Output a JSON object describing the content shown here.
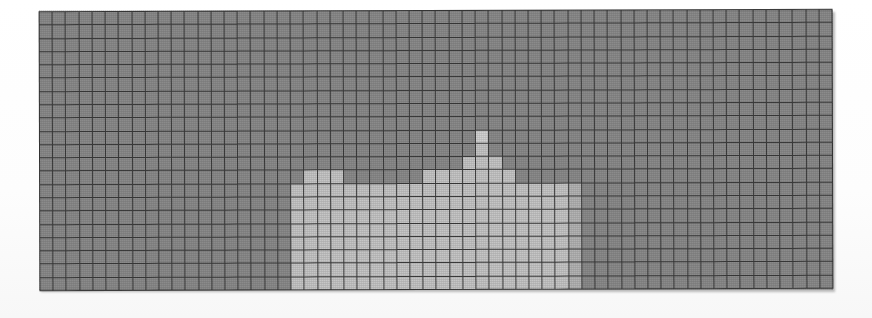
{
  "figure": {
    "type_label": "heatmap"
  },
  "palette": {
    "background_cell": "#8b8b8b",
    "gridline": "#3b3b3b",
    "page": "#ffffff",
    "level_0": "#8b8b8b",
    "level_1": "#9d9d9d",
    "level_2": "#b4b4b4",
    "level_3": "#c6c6c6",
    "level_4": "#d2d2d2",
    "level_5": "#dcdcdc"
  },
  "chart_data": {
    "type": "heatmap",
    "subtitle": "",
    "xlabel": "",
    "ylabel": "",
    "xticklabels": [],
    "yticklabels": [],
    "legend": [],
    "annotations": [],
    "grid": true,
    "gridline_color": "#3b3b3b",
    "ncols": 60,
    "nrows": 21,
    "xlim": [
      0,
      60
    ],
    "ylim": [
      0,
      21
    ],
    "zlim": [
      0,
      5
    ],
    "colorscale": [
      "#8b8b8b",
      "#9d9d9d",
      "#b4b4b4",
      "#c6c6c6",
      "#d2d2d2",
      "#dcdcdc"
    ],
    "values": [
      [
        0,
        0,
        0,
        0,
        0,
        0,
        0,
        0,
        0,
        0,
        0,
        0,
        0,
        0,
        0,
        0,
        0,
        0,
        0,
        0,
        0,
        0,
        0,
        0,
        0,
        0,
        0,
        0,
        0,
        0,
        0,
        0,
        0,
        0,
        0,
        0,
        0,
        0,
        0,
        0,
        0,
        0,
        0,
        0,
        0,
        0,
        0,
        0,
        0,
        0,
        0,
        0,
        0,
        0,
        0,
        0,
        0,
        0,
        0,
        0
      ],
      [
        0,
        0,
        0,
        0,
        0,
        0,
        0,
        0,
        0,
        0,
        0,
        0,
        0,
        0,
        0,
        0,
        0,
        0,
        0,
        0,
        0,
        0,
        0,
        0,
        0,
        0,
        0,
        0,
        0,
        0,
        0,
        0,
        0,
        0,
        0,
        0,
        0,
        0,
        0,
        0,
        0,
        0,
        0,
        0,
        0,
        0,
        0,
        0,
        0,
        0,
        0,
        0,
        0,
        0,
        0,
        0,
        0,
        0,
        0,
        0
      ],
      [
        0,
        0,
        0,
        0,
        0,
        0,
        0,
        0,
        0,
        0,
        0,
        0,
        0,
        0,
        0,
        0,
        0,
        0,
        0,
        0,
        0,
        0,
        0,
        0,
        0,
        0,
        0,
        0,
        0,
        0,
        0,
        0,
        0,
        0,
        0,
        0,
        0,
        0,
        0,
        0,
        0,
        0,
        0,
        0,
        0,
        0,
        0,
        0,
        0,
        0,
        0,
        0,
        0,
        0,
        0,
        0,
        0,
        0,
        0,
        0
      ],
      [
        0,
        0,
        0,
        0,
        0,
        0,
        0,
        0,
        0,
        0,
        0,
        0,
        0,
        0,
        0,
        0,
        0,
        0,
        0,
        0,
        0,
        0,
        0,
        0,
        0,
        0,
        0,
        0,
        0,
        0,
        0,
        0,
        0,
        0,
        0,
        0,
        0,
        0,
        0,
        0,
        0,
        0,
        0,
        0,
        0,
        0,
        0,
        0,
        0,
        0,
        0,
        0,
        0,
        0,
        0,
        0,
        0,
        0,
        0,
        0
      ],
      [
        0,
        0,
        0,
        0,
        0,
        0,
        0,
        0,
        0,
        0,
        0,
        0,
        0,
        0,
        0,
        0,
        0,
        0,
        0,
        0,
        0,
        0,
        0,
        0,
        0,
        0,
        0,
        0,
        0,
        0,
        0,
        0,
        0,
        0,
        0,
        0,
        0,
        0,
        0,
        0,
        0,
        0,
        0,
        0,
        0,
        0,
        0,
        0,
        0,
        0,
        0,
        0,
        0,
        0,
        0,
        0,
        0,
        0,
        0,
        0
      ],
      [
        0,
        0,
        0,
        0,
        0,
        0,
        0,
        0,
        0,
        0,
        0,
        0,
        0,
        0,
        0,
        0,
        0,
        0,
        0,
        0,
        0,
        0,
        0,
        0,
        0,
        0,
        0,
        0,
        0,
        0,
        0,
        0,
        0,
        0,
        0,
        0,
        0,
        0,
        0,
        0,
        0,
        0,
        0,
        0,
        0,
        0,
        0,
        0,
        0,
        0,
        0,
        0,
        0,
        0,
        0,
        0,
        0,
        0,
        0,
        0
      ],
      [
        0,
        0,
        0,
        0,
        0,
        0,
        0,
        0,
        0,
        0,
        0,
        0,
        0,
        0,
        0,
        0,
        0,
        0,
        0,
        0,
        0,
        0,
        0,
        0,
        0,
        0,
        0,
        0,
        0,
        0,
        0,
        0,
        0,
        0,
        0,
        0,
        0,
        0,
        0,
        0,
        0,
        0,
        0,
        0,
        0,
        0,
        0,
        0,
        0,
        0,
        0,
        0,
        0,
        0,
        0,
        0,
        0,
        0,
        0,
        0
      ],
      [
        0,
        0,
        0,
        0,
        0,
        0,
        0,
        0,
        0,
        0,
        0,
        0,
        0,
        0,
        0,
        0,
        0,
        0,
        0,
        0,
        0,
        0,
        0,
        0,
        0,
        0,
        0,
        0,
        0,
        0,
        0,
        0,
        0,
        0,
        0,
        0,
        0,
        0,
        0,
        0,
        0,
        0,
        0,
        0,
        0,
        0,
        0,
        0,
        0,
        0,
        0,
        0,
        0,
        0,
        0,
        0,
        0,
        0,
        0,
        0
      ],
      [
        0,
        0,
        0,
        0,
        0,
        0,
        0,
        0,
        0,
        0,
        0,
        0,
        0,
        0,
        0,
        0,
        0,
        0,
        0,
        0,
        0,
        0,
        0,
        0,
        0,
        0,
        0,
        0,
        0,
        0,
        0,
        0,
        0,
        0,
        0,
        0,
        0,
        0,
        0,
        0,
        0,
        0,
        0,
        0,
        0,
        0,
        0,
        0,
        0,
        0,
        0,
        0,
        0,
        0,
        0,
        0,
        0,
        0,
        0,
        0
      ],
      [
        0,
        0,
        0,
        0,
        0,
        0,
        0,
        0,
        0,
        0,
        0,
        0,
        0,
        0,
        0,
        0,
        0,
        0,
        0,
        0,
        0,
        0,
        0,
        0,
        0,
        0,
        0,
        0,
        0,
        0,
        0,
        0,
        0,
        4,
        0,
        0,
        0,
        0,
        0,
        0,
        0,
        0,
        0,
        0,
        0,
        0,
        0,
        0,
        0,
        0,
        0,
        0,
        0,
        0,
        0,
        0,
        0,
        0,
        0,
        0
      ],
      [
        0,
        0,
        0,
        0,
        0,
        0,
        0,
        0,
        0,
        0,
        0,
        0,
        0,
        0,
        0,
        0,
        0,
        0,
        0,
        0,
        0,
        0,
        0,
        0,
        0,
        0,
        0,
        0,
        0,
        0,
        0,
        0,
        0,
        3,
        0,
        0,
        0,
        0,
        0,
        0,
        0,
        0,
        0,
        0,
        0,
        0,
        0,
        0,
        0,
        0,
        0,
        0,
        0,
        0,
        0,
        0,
        0,
        0,
        0,
        0
      ],
      [
        0,
        0,
        0,
        0,
        0,
        0,
        0,
        0,
        0,
        0,
        0,
        0,
        0,
        0,
        0,
        0,
        0,
        0,
        0,
        0,
        0,
        0,
        0,
        0,
        0,
        0,
        0,
        0,
        0,
        0,
        0,
        0,
        3,
        3,
        3,
        0,
        0,
        0,
        0,
        0,
        0,
        0,
        0,
        0,
        0,
        0,
        0,
        0,
        0,
        0,
        0,
        0,
        0,
        0,
        0,
        0,
        0,
        0,
        0,
        0
      ],
      [
        0,
        0,
        0,
        0,
        0,
        0,
        0,
        0,
        0,
        0,
        0,
        0,
        0,
        0,
        0,
        0,
        0,
        0,
        0,
        0,
        3,
        3,
        3,
        0,
        0,
        0,
        0,
        0,
        0,
        3,
        3,
        3,
        3,
        3,
        3,
        3,
        0,
        0,
        0,
        0,
        0,
        0,
        0,
        0,
        0,
        0,
        0,
        0,
        0,
        0,
        0,
        0,
        0,
        0,
        0,
        0,
        0,
        0,
        0,
        0
      ],
      [
        0,
        0,
        0,
        0,
        0,
        0,
        0,
        0,
        0,
        0,
        0,
        0,
        0,
        0,
        0,
        0,
        0,
        0,
        0,
        3,
        3,
        3,
        3,
        3,
        3,
        3,
        3,
        3,
        3,
        3,
        3,
        3,
        3,
        3,
        3,
        3,
        3,
        3,
        3,
        3,
        2,
        0,
        0,
        0,
        0,
        0,
        0,
        0,
        0,
        0,
        0,
        0,
        0,
        0,
        0,
        0,
        0,
        0,
        0,
        0
      ],
      [
        0,
        0,
        0,
        0,
        0,
        0,
        0,
        0,
        0,
        0,
        0,
        0,
        0,
        0,
        0,
        0,
        0,
        0,
        0,
        3,
        3,
        3,
        3,
        3,
        3,
        3,
        3,
        3,
        3,
        3,
        3,
        3,
        3,
        3,
        3,
        3,
        3,
        3,
        3,
        3,
        2,
        0,
        0,
        0,
        0,
        0,
        0,
        0,
        0,
        0,
        0,
        0,
        0,
        0,
        0,
        0,
        0,
        0,
        0,
        0
      ],
      [
        0,
        0,
        0,
        0,
        0,
        0,
        0,
        0,
        0,
        0,
        0,
        0,
        0,
        0,
        0,
        0,
        0,
        0,
        0,
        3,
        3,
        3,
        3,
        3,
        3,
        3,
        3,
        3,
        3,
        3,
        3,
        3,
        3,
        3,
        3,
        3,
        3,
        3,
        3,
        3,
        2,
        0,
        0,
        0,
        0,
        0,
        0,
        0,
        0,
        0,
        0,
        0,
        0,
        0,
        0,
        0,
        0,
        0,
        0,
        0
      ],
      [
        0,
        0,
        0,
        0,
        0,
        0,
        0,
        0,
        0,
        0,
        0,
        0,
        0,
        0,
        0,
        0,
        0,
        0,
        0,
        3,
        3,
        3,
        3,
        3,
        3,
        3,
        3,
        3,
        3,
        3,
        3,
        3,
        3,
        3,
        3,
        3,
        3,
        3,
        3,
        3,
        2,
        0,
        0,
        0,
        0,
        0,
        0,
        0,
        0,
        0,
        0,
        0,
        0,
        0,
        0,
        0,
        0,
        0,
        0,
        0
      ],
      [
        0,
        0,
        0,
        0,
        0,
        0,
        0,
        0,
        0,
        0,
        0,
        0,
        0,
        0,
        0,
        0,
        0,
        0,
        0,
        3,
        3,
        3,
        3,
        3,
        3,
        3,
        3,
        3,
        3,
        3,
        3,
        3,
        3,
        3,
        3,
        3,
        3,
        3,
        3,
        3,
        2,
        0,
        0,
        0,
        0,
        0,
        0,
        0,
        0,
        0,
        0,
        0,
        0,
        0,
        0,
        0,
        0,
        0,
        0,
        0
      ],
      [
        0,
        0,
        0,
        0,
        0,
        0,
        0,
        0,
        0,
        0,
        0,
        0,
        0,
        0,
        0,
        0,
        0,
        0,
        0,
        3,
        3,
        3,
        3,
        3,
        3,
        3,
        3,
        3,
        3,
        3,
        3,
        3,
        3,
        3,
        3,
        3,
        3,
        3,
        3,
        3,
        2,
        0,
        0,
        0,
        0,
        0,
        0,
        0,
        0,
        0,
        0,
        0,
        0,
        0,
        0,
        0,
        0,
        0,
        0,
        0
      ],
      [
        0,
        0,
        0,
        0,
        0,
        0,
        0,
        0,
        0,
        0,
        0,
        0,
        0,
        0,
        0,
        0,
        0,
        0,
        0,
        3,
        3,
        3,
        3,
        3,
        3,
        3,
        3,
        3,
        3,
        3,
        3,
        3,
        3,
        3,
        3,
        3,
        3,
        3,
        3,
        3,
        2,
        0,
        0,
        0,
        0,
        0,
        0,
        0,
        0,
        0,
        0,
        0,
        0,
        0,
        0,
        0,
        0,
        0,
        0,
        0
      ],
      [
        0,
        0,
        0,
        0,
        0,
        0,
        0,
        0,
        0,
        0,
        0,
        0,
        0,
        0,
        0,
        0,
        0,
        0,
        0,
        3,
        3,
        3,
        3,
        3,
        3,
        3,
        3,
        3,
        3,
        3,
        3,
        3,
        3,
        3,
        3,
        3,
        3,
        3,
        3,
        3,
        2,
        0,
        0,
        0,
        0,
        0,
        0,
        0,
        0,
        0,
        0,
        0,
        0,
        0,
        0,
        0,
        0,
        0,
        0,
        0
      ]
    ]
  }
}
